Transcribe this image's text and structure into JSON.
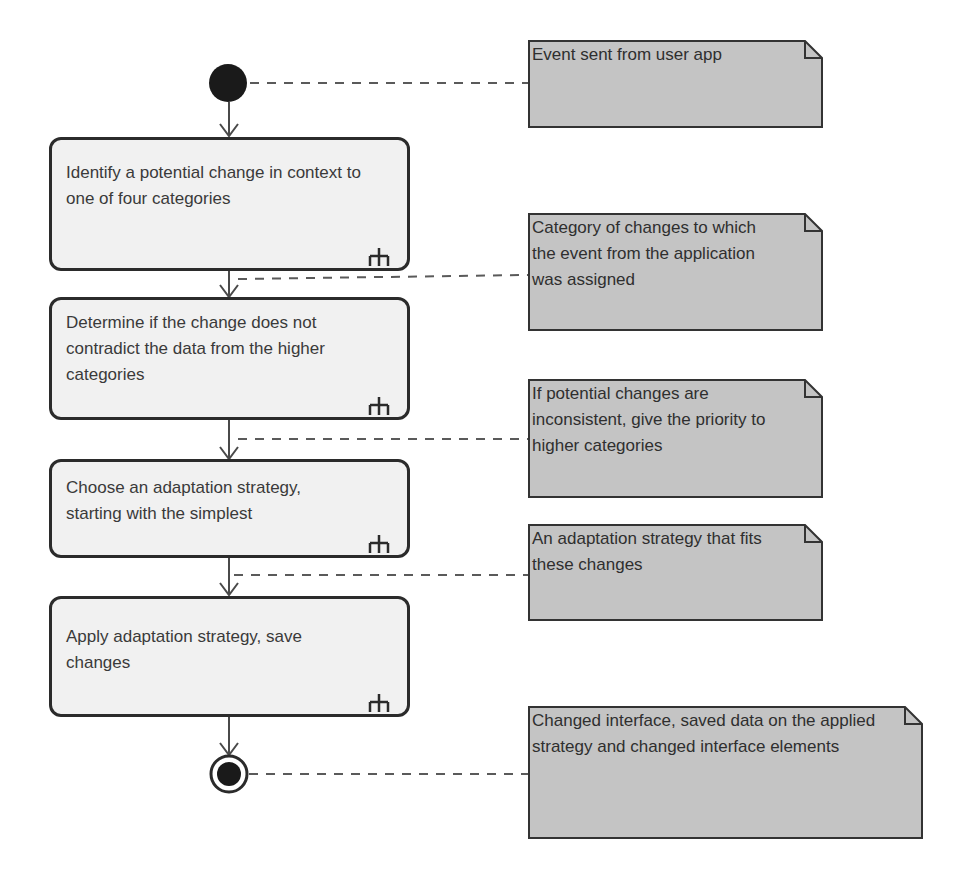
{
  "diagram": {
    "type": "UML activity diagram",
    "colors": {
      "action_fill": "#f1f1f1",
      "action_border": "#2b2b2b",
      "note_fill": "#c4c4c4",
      "note_border": "#333333",
      "node_fill": "#1a1a1a",
      "edge": "#4a4a4a",
      "dash": "#5a5a5a"
    },
    "initial_node": {
      "label": "initial-node"
    },
    "actions": [
      {
        "id": "a1",
        "text": "Identify a potential change in context to one of four categories",
        "icon": "rake-icon"
      },
      {
        "id": "a2",
        "text": "Determine if the change does not contradict the data from the higher categories",
        "icon": "rake-icon"
      },
      {
        "id": "a3",
        "text": "Choose an adaptation strategy, starting with the simplest",
        "icon": "rake-icon"
      },
      {
        "id": "a4",
        "text": "Apply adaptation strategy, save changes",
        "icon": "rake-icon"
      }
    ],
    "final_node": {
      "label": "final-node"
    },
    "notes": [
      {
        "id": "n1",
        "text": "Event sent from user app"
      },
      {
        "id": "n2",
        "text": "Category of changes to which the event from the application was assigned"
      },
      {
        "id": "n3",
        "text": "If potential changes are inconsistent, give the priority to higher categories"
      },
      {
        "id": "n4",
        "text": "An adaptation strategy that fits these changes"
      },
      {
        "id": "n5",
        "text": "Changed interface, saved data on the applied strategy and changed interface elements"
      }
    ]
  }
}
